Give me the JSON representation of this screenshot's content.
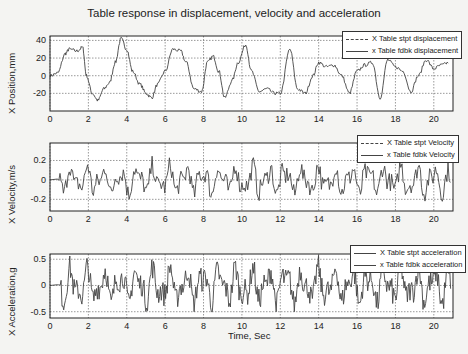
{
  "figure": {
    "title": "Table response in displacement, velocity and acceleration",
    "xlabel": "Time, Sec"
  },
  "panels": [
    {
      "ylabel": "X Position,mm",
      "legend": [
        "X Table stpt displacement",
        "x Table fdbk displacement"
      ]
    },
    {
      "ylabel": "X Velocity,m/s",
      "legend": [
        "X Table stpt Velocity",
        "x Table fdbk Velocity"
      ]
    },
    {
      "ylabel": "X Acceleration,g",
      "legend": [
        "X Table stpt acceleration",
        "x Table fdbk acceleration"
      ]
    }
  ],
  "chart_data": [
    {
      "type": "line",
      "title": "Table response in displacement, velocity and acceleration",
      "xlabel": "",
      "ylabel": "X Position,mm",
      "xlim": [
        0,
        21
      ],
      "ylim": [
        -40,
        45
      ],
      "xticks": [
        0,
        2,
        4,
        6,
        8,
        10,
        12,
        14,
        16,
        18,
        20
      ],
      "yticks": [
        -20,
        0,
        20,
        40
      ],
      "grid": true,
      "legend_position": "upper right",
      "series": [
        {
          "name": "X Table stpt displacement",
          "style": "dashed"
        },
        {
          "name": "x Table fdbk displacement",
          "style": "solid"
        }
      ],
      "x": [
        0,
        0.4,
        0.8,
        1.0,
        1.4,
        1.7,
        1.9,
        2.2,
        2.5,
        2.8,
        3.1,
        3.4,
        3.7,
        4.0,
        4.3,
        4.7,
        5.0,
        5.3,
        5.6,
        6.0,
        6.4,
        6.8,
        7.1,
        7.5,
        7.9,
        8.2,
        8.5,
        8.8,
        9.1,
        9.5,
        9.8,
        10.2,
        10.5,
        10.9,
        11.3,
        11.7,
        12.0,
        12.5,
        12.9,
        13.3,
        13.7,
        14.0,
        14.4,
        14.8,
        15.2,
        15.6,
        16.0,
        16.4,
        16.8,
        17.2,
        17.6,
        18.0,
        18.4,
        18.8,
        19.2,
        19.6,
        20.0,
        20.4,
        20.8
      ],
      "values": [
        0,
        3,
        25,
        30,
        28,
        32,
        0,
        -20,
        -28,
        -15,
        -8,
        15,
        42,
        30,
        5,
        -10,
        -20,
        -25,
        -10,
        5,
        30,
        28,
        15,
        -15,
        -18,
        15,
        22,
        5,
        -25,
        -5,
        15,
        35,
        5,
        -18,
        -15,
        -20,
        -20,
        30,
        -15,
        -20,
        0,
        15,
        10,
        12,
        0,
        -20,
        5,
        12,
        15,
        -25,
        18,
        10,
        5,
        -18,
        0,
        18,
        8,
        12,
        15
      ]
    },
    {
      "type": "line",
      "xlabel": "",
      "ylabel": "X Velocity,m/s",
      "xlim": [
        0,
        21
      ],
      "ylim": [
        -0.32,
        0.38
      ],
      "xticks": [
        0,
        2,
        4,
        6,
        8,
        10,
        12,
        14,
        16,
        18,
        20
      ],
      "yticks": [
        -0.2,
        0,
        0.2
      ],
      "grid": true,
      "legend_position": "upper right",
      "series": [
        {
          "name": "X Table stpt Velocity",
          "style": "dashed"
        },
        {
          "name": "x Table fdbk Velocity",
          "style": "solid"
        }
      ],
      "amplitude_range": [
        -0.22,
        0.25
      ],
      "description": "noisy oscillation around 0, peaks near ±0.2"
    },
    {
      "type": "line",
      "xlabel": "Time, Sec",
      "ylabel": "X Acceleration,g",
      "xlim": [
        0,
        21
      ],
      "ylim": [
        -0.62,
        0.6
      ],
      "xticks": [
        0,
        2,
        4,
        6,
        8,
        10,
        12,
        14,
        16,
        18,
        20
      ],
      "yticks": [
        -0.5,
        0,
        0.5
      ],
      "grid": true,
      "legend_position": "upper right",
      "series": [
        {
          "name": "X Table stpt acceleration",
          "style": "solid"
        },
        {
          "name": "x Table fdbk acceleration",
          "style": "solid"
        }
      ],
      "amplitude_range": [
        -0.5,
        0.6
      ],
      "description": "dense high-frequency oscillation around 0, peaks near ±0.5"
    }
  ]
}
